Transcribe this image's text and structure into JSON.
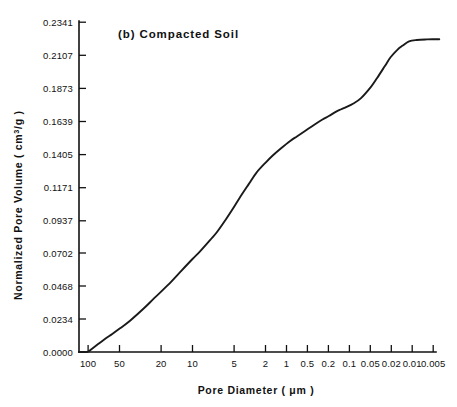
{
  "figure": {
    "panel_label": "(b) Compacted Soil",
    "background_color": "#ffffff",
    "line_color": "#1a1a1a",
    "axis_color": "#111111"
  },
  "axes": {
    "ylabel_main": "Normalized Pore Volume ( cm",
    "ylabel_superscript": "3",
    "ylabel_tail": "/g )",
    "ylabel_full": "Normalized Pore Volume ( cm3/g )",
    "xlabel_main": "Pore Diameter ( ",
    "xlabel_unit": "μm",
    "xlabel_tail": " )",
    "xlabel_full": "Pore Diameter ( μm )"
  },
  "chart_data": {
    "type": "line",
    "title": "(b) Compacted Soil",
    "xlabel": "Pore Diameter ( μm )",
    "ylabel": "Normalized Pore Volume ( cm3/g )",
    "xscale": "log-reversed",
    "xlim": [
      130.0,
      0.0042
    ],
    "ylim": [
      0.0,
      0.2341
    ],
    "grid": false,
    "legend": null,
    "xtick_labels": [
      "100",
      "50",
      "20",
      "10",
      "5",
      "2",
      "1",
      "0.5",
      "0.2",
      "0.1",
      "0.05",
      "0.02",
      "0.01",
      "0.005"
    ],
    "xtick_values": [
      100,
      50,
      20,
      10,
      5,
      2,
      1,
      0.5,
      0.2,
      0.1,
      0.05,
      0.02,
      0.01,
      0.005
    ],
    "ytick_labels": [
      "0.0000",
      "0.0234",
      "0.0468",
      "0.0702",
      "0.0937",
      "0.1171",
      "0.1405",
      "0.1639",
      "0.1873",
      "0.2107",
      "0.2341"
    ],
    "ytick_values": [
      0.0,
      0.0234,
      0.0468,
      0.0702,
      0.0937,
      0.1171,
      0.1405,
      0.1639,
      0.1873,
      0.2107,
      0.2341
    ],
    "series": [
      {
        "name": "Compacted Soil cumulative intrusion",
        "x": [
          130,
          110,
          100,
          90,
          75,
          60,
          50,
          40,
          30,
          20,
          15,
          10,
          7,
          5,
          4,
          3,
          2.5,
          2,
          1.6,
          1.3,
          1.0,
          0.8,
          0.6,
          0.5,
          0.4,
          0.3,
          0.25,
          0.2,
          0.15,
          0.12,
          0.1,
          0.08,
          0.07,
          0.06,
          0.05,
          0.04,
          0.03,
          0.025,
          0.02,
          0.017,
          0.014,
          0.012,
          0.01,
          0.008,
          0.006,
          0.005,
          0.0042
        ],
        "y": [
          0.0,
          0.0,
          0.0002,
          0.0022,
          0.0056,
          0.0098,
          0.0128,
          0.0168,
          0.0222,
          0.0312,
          0.0382,
          0.0478,
          0.0572,
          0.066,
          0.0716,
          0.0796,
          0.0848,
          0.0926,
          0.101,
          0.1092,
          0.119,
          0.1272,
          0.135,
          0.1395,
          0.1443,
          0.15,
          0.153,
          0.1567,
          0.1615,
          0.165,
          0.1675,
          0.1708,
          0.1723,
          0.174,
          0.1762,
          0.18,
          0.188,
          0.1945,
          0.203,
          0.2092,
          0.2145,
          0.2175,
          0.2205,
          0.2215,
          0.2219,
          0.222,
          0.222
        ]
      }
    ],
    "annotations": [
      {
        "text": "(b) Compacted Soil",
        "position": "upper-left-inside"
      }
    ]
  }
}
